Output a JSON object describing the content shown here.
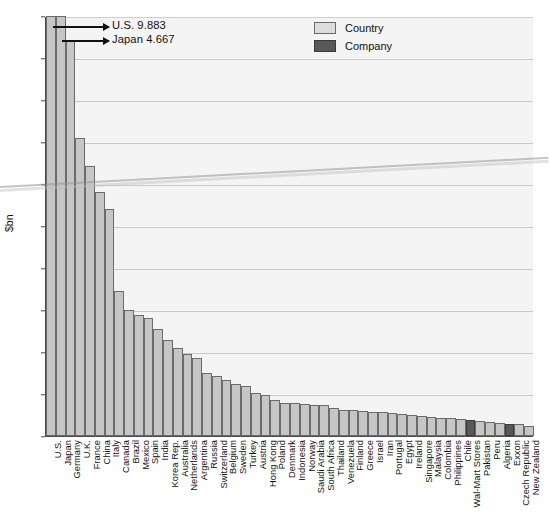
{
  "chart_data": {
    "type": "bar",
    "title": "",
    "xlabel": "",
    "ylabel": "$bn",
    "ylim": [
      0,
      2000
    ],
    "ytick_labels": [
      "0",
      "200",
      "400",
      "600",
      "800",
      "1.000",
      "1.200",
      "1.400",
      "1.600",
      "1.800",
      "2.000"
    ],
    "ytick_values": [
      0,
      200,
      400,
      600,
      800,
      1000,
      1200,
      1400,
      1600,
      1800,
      2000
    ],
    "grid": true,
    "legend_position": "top-center-right",
    "legend": [
      {
        "label": "Country",
        "color": "#c6c6c6"
      },
      {
        "label": "Company",
        "color": "#585858"
      }
    ],
    "annotations": [
      {
        "text": "U.S. 9.883",
        "target": "U.S.",
        "note": "bar truncated at axis maximum"
      },
      {
        "text": "Japan 4.667",
        "target": "Japan",
        "note": "bar truncated at axis maximum"
      }
    ],
    "categories": [
      "U.S.",
      "Japan",
      "Germany",
      "U.K.",
      "France",
      "China",
      "Italy",
      "Canada",
      "Brazil",
      "Mexico",
      "Spain",
      "India",
      "Korea Rep.",
      "Australia",
      "Netherlands",
      "Argentina",
      "Russia",
      "Switzerland",
      "Belgium",
      "Sweden",
      "Turkey",
      "Austria",
      "Hong Kong",
      "Poland",
      "Denmark",
      "Indonesia",
      "Norway",
      "Saudi Arabia",
      "South Africa",
      "Thailand",
      "Venezuela",
      "Finland",
      "Greece",
      "Israel",
      "Iran",
      "Portugal",
      "Egypt",
      "Ireland",
      "Singapore",
      "Malaysia",
      "Colombia",
      "Philippines",
      "Chile",
      "Wal-Mart Stores",
      "Pakistan",
      "Peru",
      "Algeria",
      "Exxon",
      "Czech Republic",
      "New Zealand"
    ],
    "values": [
      2000,
      2000,
      1880,
      1420,
      1285,
      1160,
      1080,
      690,
      600,
      575,
      560,
      510,
      455,
      420,
      390,
      370,
      300,
      285,
      265,
      250,
      240,
      205,
      195,
      170,
      158,
      155,
      152,
      150,
      148,
      135,
      125,
      122,
      120,
      115,
      112,
      110,
      105,
      100,
      96,
      92,
      88,
      85,
      80,
      76,
      72,
      68,
      60,
      58,
      55,
      50
    ],
    "series_type": [
      "country",
      "country",
      "country",
      "country",
      "country",
      "country",
      "country",
      "country",
      "country",
      "country",
      "country",
      "country",
      "country",
      "country",
      "country",
      "country",
      "country",
      "country",
      "country",
      "country",
      "country",
      "country",
      "country",
      "country",
      "country",
      "country",
      "country",
      "country",
      "country",
      "country",
      "country",
      "country",
      "country",
      "country",
      "country",
      "country",
      "country",
      "country",
      "country",
      "country",
      "country",
      "country",
      "country",
      "company",
      "country",
      "country",
      "country",
      "company",
      "country",
      "country"
    ]
  },
  "colors": {
    "country": "#c6c6c6",
    "company": "#585858",
    "plot_background": "#f4f4f4",
    "axis": "#4a4a4a",
    "grid": "#c9c9c9"
  }
}
